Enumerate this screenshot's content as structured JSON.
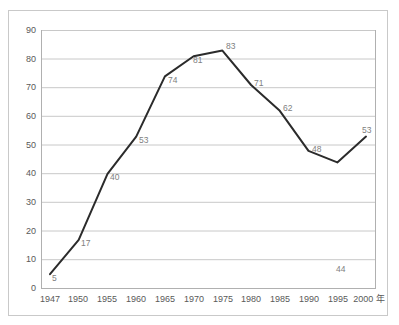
{
  "chart_data": {
    "type": "line",
    "title": "",
    "subtitle": "",
    "xlabel": "年",
    "ylabel": "",
    "categories": [
      "1947",
      "1950",
      "1955",
      "1960",
      "1965",
      "1970",
      "1975",
      "1980",
      "1985",
      "1990",
      "1995",
      "2000"
    ],
    "values": [
      5,
      17,
      40,
      53,
      74,
      81,
      83,
      71,
      62,
      48,
      44,
      53
    ],
    "series": [
      {
        "name": "",
        "values": [
          5,
          17,
          40,
          53,
          74,
          81,
          83,
          71,
          62,
          48,
          44,
          53
        ]
      }
    ],
    "data_labels": [
      "5",
      "17",
      "40",
      "53",
      "74",
      "81",
      "83",
      "71",
      "62",
      "48",
      "44",
      "53"
    ],
    "ylim": [
      0,
      90
    ],
    "ytick_values": [
      0,
      10,
      20,
      30,
      40,
      50,
      60,
      70,
      80,
      90
    ],
    "ytick_labels": [
      "0",
      "10",
      "20",
      "30",
      "40",
      "50",
      "60",
      "70",
      "80",
      "90"
    ],
    "xtick_labels": [
      "1947",
      "1950",
      "1955",
      "1960",
      "1965",
      "1970",
      "1975",
      "1980",
      "1985",
      "1990",
      "1995",
      "2000 年"
    ],
    "grid": {
      "horizontal": true,
      "vertical": false
    },
    "legend": {
      "visible": false,
      "position": "none"
    },
    "colors": {
      "line": "#2b2b2b",
      "gridline": "#c8c8c8",
      "plot_border": "#b0b0b0",
      "frame_border": "#c9c9c9",
      "tick_label": "#595959",
      "data_label": "#808080",
      "background": "#ffffff"
    },
    "line_width": 2,
    "markers": false
  }
}
